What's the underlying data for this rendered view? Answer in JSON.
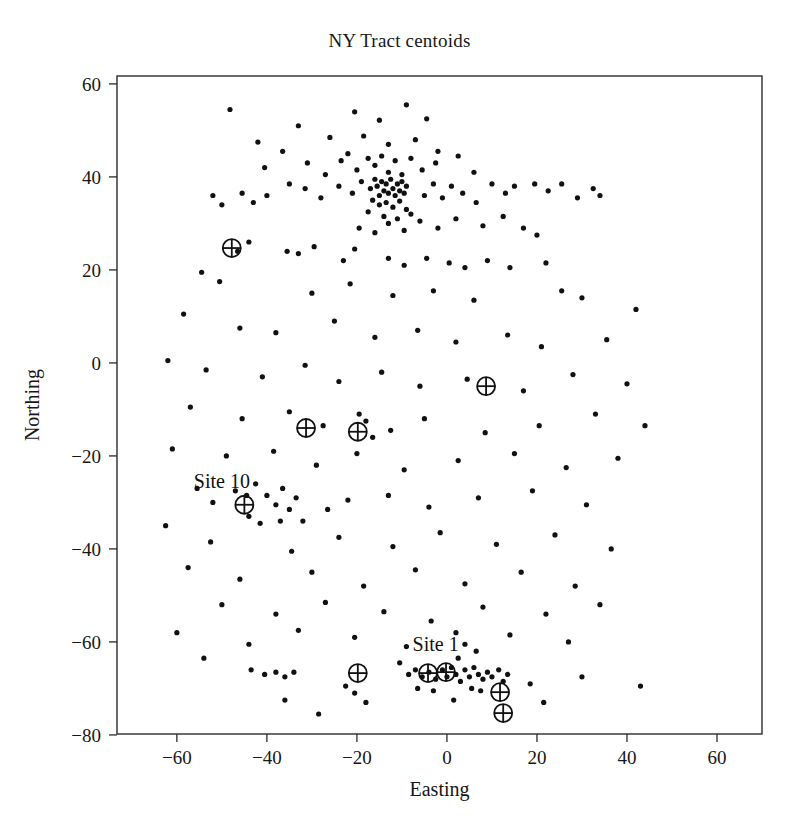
{
  "figure": {
    "title": "NY Tract centoids",
    "width": 799,
    "height": 839,
    "background": "#ffffff",
    "foreground": "#1a1a1a"
  },
  "axes": {
    "xlabel": "Easting",
    "ylabel": "Northing",
    "x_ticks": [
      -60,
      -40,
      -20,
      0,
      20,
      40,
      60
    ],
    "y_ticks": [
      -80,
      -60,
      -40,
      -20,
      0,
      20,
      40,
      60
    ],
    "x_tick_labels": [
      "−60",
      "−40",
      "−20",
      "0",
      "20",
      "40",
      "60"
    ],
    "y_tick_labels": [
      "−80",
      "−60",
      "−40",
      "−20",
      "0",
      "20",
      "40",
      "60"
    ],
    "xlim": [
      -73.3,
      70.0
    ],
    "ylim": [
      -79.8,
      61.7
    ],
    "grid": false,
    "frame": true,
    "frame_px": {
      "left": 117,
      "right": 762,
      "top": 76,
      "bottom": 734
    }
  },
  "annotations": [
    {
      "text": "Site 10",
      "x": -50.0,
      "y": -27.0,
      "name": "site-10-label"
    },
    {
      "text": "Site 1",
      "x": -2.5,
      "y": -62.0,
      "name": "site-1-label"
    }
  ],
  "chart_data": {
    "type": "scatter",
    "title": "NY Tract centoids",
    "xlabel": "Easting",
    "ylabel": "Northing",
    "xlim": [
      -73.3,
      70.0
    ],
    "ylim": [
      -79.8,
      61.7
    ],
    "grid": false,
    "legend": null,
    "series": [
      {
        "name": "tract centroids",
        "marker": "filled-circle",
        "marker_size": 4.2,
        "color": "#111111",
        "points": [
          [
            -48.2,
            54.5
          ],
          [
            -33.0,
            51.0
          ],
          [
            -20.5,
            54.0
          ],
          [
            -15.0,
            52.2
          ],
          [
            -9.0,
            55.5
          ],
          [
            -4.5,
            52.5
          ],
          [
            -42.0,
            47.5
          ],
          [
            -36.5,
            45.5
          ],
          [
            -26.0,
            48.5
          ],
          [
            -22.0,
            45.0
          ],
          [
            -18.5,
            48.8
          ],
          [
            -13.0,
            47.0
          ],
          [
            -7.0,
            48.0
          ],
          [
            -2.0,
            45.5
          ],
          [
            -40.5,
            42.0
          ],
          [
            -31.0,
            43.0
          ],
          [
            -27.0,
            40.5
          ],
          [
            -23.5,
            43.5
          ],
          [
            -20.0,
            41.5
          ],
          [
            -17.5,
            44.0
          ],
          [
            -16.0,
            42.5
          ],
          [
            -14.5,
            44.5
          ],
          [
            -13.0,
            41.0
          ],
          [
            -11.5,
            43.5
          ],
          [
            -10.0,
            40.5
          ],
          [
            -8.0,
            44.0
          ],
          [
            -5.5,
            41.5
          ],
          [
            -2.5,
            43.0
          ],
          [
            2.5,
            44.5
          ],
          [
            6.0,
            41.0
          ],
          [
            -24.0,
            38.0
          ],
          [
            -21.0,
            36.5
          ],
          [
            -19.0,
            39.0
          ],
          [
            -17.0,
            37.5
          ],
          [
            -16.0,
            39.5
          ],
          [
            -15.5,
            38.0
          ],
          [
            -15.0,
            36.0
          ],
          [
            -14.5,
            39.0
          ],
          [
            -14.0,
            37.0
          ],
          [
            -13.5,
            38.5
          ],
          [
            -13.0,
            36.5
          ],
          [
            -12.5,
            39.5
          ],
          [
            -12.0,
            37.5
          ],
          [
            -11.5,
            36.0
          ],
          [
            -11.0,
            38.5
          ],
          [
            -10.5,
            37.0
          ],
          [
            -10.0,
            39.0
          ],
          [
            -9.5,
            36.5
          ],
          [
            -9.0,
            38.0
          ],
          [
            -16.5,
            35.0
          ],
          [
            -15.0,
            34.0
          ],
          [
            -13.5,
            34.5
          ],
          [
            -12.0,
            33.5
          ],
          [
            -10.5,
            34.8
          ],
          [
            -9.0,
            33.0
          ],
          [
            -17.5,
            32.5
          ],
          [
            -14.0,
            31.5
          ],
          [
            -11.0,
            31.0
          ],
          [
            -8.0,
            32.0
          ],
          [
            -5.0,
            36.0
          ],
          [
            -3.0,
            38.5
          ],
          [
            -1.0,
            35.5
          ],
          [
            1.0,
            38.0
          ],
          [
            3.5,
            36.5
          ],
          [
            6.5,
            34.5
          ],
          [
            10.0,
            38.5
          ],
          [
            13.0,
            36.5
          ],
          [
            15.0,
            38.0
          ],
          [
            19.5,
            38.5
          ],
          [
            22.5,
            37.0
          ],
          [
            25.5,
            38.5
          ],
          [
            29.0,
            35.5
          ],
          [
            32.5,
            37.5
          ],
          [
            34.0,
            36.0
          ],
          [
            -28.0,
            35.5
          ],
          [
            -31.5,
            37.5
          ],
          [
            -35.0,
            38.5
          ],
          [
            -40.0,
            36.0
          ],
          [
            -43.0,
            34.5
          ],
          [
            -45.5,
            36.5
          ],
          [
            -50.0,
            34.0
          ],
          [
            -52.0,
            36.0
          ],
          [
            -19.5,
            29.0
          ],
          [
            -16.0,
            28.0
          ],
          [
            -13.0,
            30.0
          ],
          [
            -9.5,
            28.5
          ],
          [
            -6.0,
            30.5
          ],
          [
            -2.0,
            29.0
          ],
          [
            2.0,
            31.0
          ],
          [
            8.0,
            29.5
          ],
          [
            12.5,
            31.5
          ],
          [
            17.0,
            29.0
          ],
          [
            20.0,
            27.5
          ],
          [
            -44.0,
            26.0
          ],
          [
            -46.5,
            24.0
          ],
          [
            -35.5,
            24.0
          ],
          [
            -33.0,
            23.5
          ],
          [
            -29.5,
            25.0
          ],
          [
            -23.0,
            22.0
          ],
          [
            -20.5,
            24.5
          ],
          [
            -13.0,
            22.5
          ],
          [
            -9.5,
            21.0
          ],
          [
            -4.5,
            22.5
          ],
          [
            0.5,
            21.5
          ],
          [
            4.0,
            20.5
          ],
          [
            9.0,
            22.0
          ],
          [
            14.0,
            20.5
          ],
          [
            22.0,
            21.5
          ],
          [
            -54.5,
            19.5
          ],
          [
            -50.5,
            17.5
          ],
          [
            -30.0,
            15.0
          ],
          [
            -21.5,
            17.0
          ],
          [
            -12.0,
            14.5
          ],
          [
            -3.0,
            15.5
          ],
          [
            6.0,
            13.5
          ],
          [
            25.5,
            15.5
          ],
          [
            30.0,
            14.0
          ],
          [
            42.0,
            11.5
          ],
          [
            -58.5,
            10.5
          ],
          [
            -46.0,
            7.5
          ],
          [
            -38.0,
            6.5
          ],
          [
            -25.0,
            9.0
          ],
          [
            -16.0,
            5.5
          ],
          [
            -6.5,
            7.0
          ],
          [
            2.0,
            4.5
          ],
          [
            13.5,
            6.0
          ],
          [
            21.0,
            3.5
          ],
          [
            35.5,
            5.0
          ],
          [
            -62.0,
            0.5
          ],
          [
            -53.5,
            -1.5
          ],
          [
            -41.0,
            -3.0
          ],
          [
            -31.5,
            -0.5
          ],
          [
            -24.0,
            -4.0
          ],
          [
            -14.5,
            -2.0
          ],
          [
            -6.0,
            -5.0
          ],
          [
            4.5,
            -3.5
          ],
          [
            17.0,
            -6.0
          ],
          [
            28.0,
            -2.5
          ],
          [
            40.0,
            -4.5
          ],
          [
            -57.0,
            -9.5
          ],
          [
            -45.5,
            -12.0
          ],
          [
            -35.0,
            -10.5
          ],
          [
            -27.5,
            -13.5
          ],
          [
            -19.5,
            -11.0
          ],
          [
            -18.0,
            -12.5
          ],
          [
            -16.5,
            -16.0
          ],
          [
            -12.5,
            -14.5
          ],
          [
            -5.0,
            -12.0
          ],
          [
            8.5,
            -15.0
          ],
          [
            20.5,
            -13.5
          ],
          [
            33.0,
            -11.0
          ],
          [
            44.0,
            -13.5
          ],
          [
            -61.0,
            -18.5
          ],
          [
            -49.0,
            -20.0
          ],
          [
            -38.5,
            -19.0
          ],
          [
            -29.0,
            -22.0
          ],
          [
            -20.0,
            -19.5
          ],
          [
            -9.5,
            -23.0
          ],
          [
            2.5,
            -21.0
          ],
          [
            15.0,
            -19.5
          ],
          [
            26.5,
            -22.5
          ],
          [
            38.0,
            -20.5
          ],
          [
            -55.5,
            -27.0
          ],
          [
            -44.5,
            -28.5
          ],
          [
            -52.0,
            -30.0
          ],
          [
            -47.0,
            -27.5
          ],
          [
            -42.5,
            -26.0
          ],
          [
            -40.0,
            -28.5
          ],
          [
            -38.0,
            -30.5
          ],
          [
            -36.5,
            -27.0
          ],
          [
            -35.0,
            -31.5
          ],
          [
            -33.5,
            -29.0
          ],
          [
            -44.0,
            -33.0
          ],
          [
            -41.5,
            -34.5
          ],
          [
            -37.0,
            -34.0
          ],
          [
            -32.0,
            -34.0
          ],
          [
            -26.5,
            -31.5
          ],
          [
            -22.0,
            -29.5
          ],
          [
            -13.0,
            -28.5
          ],
          [
            -4.0,
            -31.0
          ],
          [
            7.0,
            -29.0
          ],
          [
            19.0,
            -27.5
          ],
          [
            31.0,
            -30.5
          ],
          [
            -62.5,
            -35.0
          ],
          [
            -52.5,
            -38.5
          ],
          [
            -34.5,
            -40.5
          ],
          [
            -24.0,
            -37.5
          ],
          [
            -12.0,
            -39.5
          ],
          [
            -1.5,
            -36.5
          ],
          [
            11.0,
            -39.0
          ],
          [
            24.0,
            -37.0
          ],
          [
            36.5,
            -40.0
          ],
          [
            -57.5,
            -44.0
          ],
          [
            -46.0,
            -46.5
          ],
          [
            -30.0,
            -45.0
          ],
          [
            -18.5,
            -48.0
          ],
          [
            -7.0,
            -44.5
          ],
          [
            4.0,
            -47.5
          ],
          [
            16.5,
            -45.0
          ],
          [
            28.5,
            -48.0
          ],
          [
            -50.0,
            -52.0
          ],
          [
            -38.0,
            -54.0
          ],
          [
            -27.0,
            -51.5
          ],
          [
            -14.0,
            -53.5
          ],
          [
            -3.5,
            -55.5
          ],
          [
            8.0,
            -52.5
          ],
          [
            22.0,
            -54.0
          ],
          [
            34.0,
            -52.0
          ],
          [
            -60.0,
            -58.0
          ],
          [
            -44.0,
            -60.5
          ],
          [
            -33.0,
            -57.5
          ],
          [
            -20.5,
            -59.0
          ],
          [
            -9.0,
            -61.0
          ],
          [
            2.0,
            -58.0
          ],
          [
            2.5,
            -63.5
          ],
          [
            4.0,
            -60.5
          ],
          [
            6.5,
            -62.0
          ],
          [
            14.0,
            -58.5
          ],
          [
            27.0,
            -60.0
          ],
          [
            -54.0,
            -63.5
          ],
          [
            -43.5,
            -66.0
          ],
          [
            -40.5,
            -67.0
          ],
          [
            -38.0,
            -66.5
          ],
          [
            -36.0,
            -67.5
          ],
          [
            -34.0,
            -66.5
          ],
          [
            -22.5,
            -69.5
          ],
          [
            -10.5,
            -64.5
          ],
          [
            -8.5,
            -67.0
          ],
          [
            -7.0,
            -66.0
          ],
          [
            -5.5,
            -67.5
          ],
          [
            -4.0,
            -66.5
          ],
          [
            -2.5,
            -68.0
          ],
          [
            -1.0,
            -66.0
          ],
          [
            0.0,
            -67.5
          ],
          [
            1.0,
            -65.5
          ],
          [
            2.0,
            -67.0
          ],
          [
            3.0,
            -68.5
          ],
          [
            4.0,
            -66.0
          ],
          [
            5.0,
            -67.5
          ],
          [
            6.0,
            -65.5
          ],
          [
            7.0,
            -67.0
          ],
          [
            8.0,
            -68.0
          ],
          [
            9.0,
            -66.5
          ],
          [
            10.0,
            -67.5
          ],
          [
            11.5,
            -66.0
          ],
          [
            12.5,
            -68.5
          ],
          [
            13.5,
            -67.0
          ],
          [
            5.5,
            -70.0
          ],
          [
            7.5,
            -70.5
          ],
          [
            -3.0,
            -70.5
          ],
          [
            -6.5,
            -70.0
          ],
          [
            1.5,
            -72.5
          ],
          [
            18.5,
            -69.0
          ],
          [
            30.0,
            -67.5
          ],
          [
            43.0,
            -69.5
          ],
          [
            -18.0,
            -73.0
          ],
          [
            -36.0,
            -72.5
          ],
          [
            -28.5,
            -75.5
          ],
          [
            -20.5,
            -71.0
          ],
          [
            21.5,
            -73.0
          ]
        ]
      },
      {
        "name": "monitoring sites",
        "marker": "crossed-circle",
        "marker_size": 9,
        "color": "#111111",
        "points": [
          [
            -47.8,
            24.7
          ],
          [
            -31.3,
            -14.0
          ],
          [
            -19.8,
            -14.8
          ],
          [
            -45.0,
            -30.5
          ],
          [
            8.7,
            -5.0
          ],
          [
            -19.8,
            -66.7
          ],
          [
            -4.2,
            -66.7
          ],
          [
            -0.2,
            -66.5
          ],
          [
            11.8,
            -70.8
          ],
          [
            12.5,
            -75.3
          ]
        ]
      }
    ]
  }
}
